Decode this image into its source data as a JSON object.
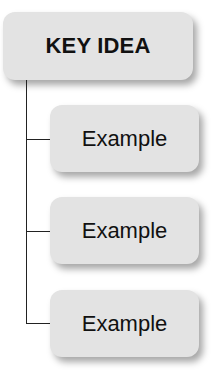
{
  "diagram": {
    "type": "tree",
    "root": {
      "label": "KEY IDEA"
    },
    "children": [
      {
        "label": "Example"
      },
      {
        "label": "Example"
      },
      {
        "label": "Example"
      }
    ],
    "colors": {
      "box_fill": "#e3e3e3",
      "text": "#111111",
      "connector": "#222222"
    }
  }
}
